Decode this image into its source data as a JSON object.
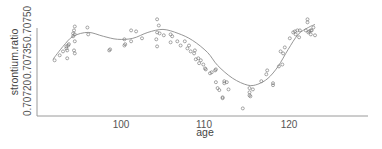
{
  "chart_data": {
    "type": "scatter",
    "title": "",
    "xlabel": "age",
    "ylabel": "strontium.ratio",
    "xlim": [
      91,
      130
    ],
    "ylim": [
      0.70716,
      0.70752
    ],
    "x_ticks": [
      100,
      110,
      120
    ],
    "x_tick_labels": [
      "100",
      "110",
      "120"
    ],
    "y_ticks": [
      0.7072,
      0.70735,
      0.7075
    ],
    "y_tick_labels": [
      "0.70720",
      "0.70735",
      "0.70750"
    ],
    "grid": false,
    "legend": null,
    "series": [
      {
        "name": "observations",
        "kind": "points",
        "marker": "open-circle",
        "x": [
          92.1,
          92.7,
          93.1,
          93.5,
          93.5,
          93.6,
          93.7,
          93.6,
          93.8,
          94.3,
          94.4,
          94.3,
          94.5,
          94.5,
          94.5,
          94.4,
          94.5,
          96.0,
          96.1,
          98.6,
          98.7,
          100.4,
          100.4,
          100.5,
          101.2,
          101.2,
          101.8,
          102.5,
          104.3,
          104.3,
          104.5,
          104.2,
          104.3,
          104.6,
          105.1,
          105.9,
          105.9,
          106.1,
          106.7,
          107.1,
          107.6,
          107.9,
          108.1,
          108.3,
          108.7,
          108.8,
          108.9,
          109.2,
          109.3,
          109.5,
          109.8,
          110.0,
          110.1,
          110.6,
          110.8,
          111.2,
          111.3,
          111.3,
          111.5,
          111.7,
          112.1,
          112.1,
          112.3,
          112.3,
          112.8,
          112.6,
          114.5,
          115.3,
          115.3,
          115.4,
          115.3,
          115.7,
          116.7,
          117.3,
          117.4,
          118.1,
          118.1,
          118.8,
          119.0,
          119.3,
          119.2,
          119.5,
          120.1,
          120.5,
          120.7,
          120.8,
          121.0,
          121.2,
          121.3,
          122.0,
          122.3,
          122.4,
          122.6,
          122.7,
          122.9,
          123.1,
          122.2,
          122.2,
          122.6
        ],
        "y": [
          0.707353,
          0.707373,
          0.707389,
          0.707401,
          0.707409,
          0.707393,
          0.707413,
          0.707361,
          0.707418,
          0.70745,
          0.707474,
          0.707462,
          0.70749,
          0.707458,
          0.70743,
          0.707393,
          0.707381,
          0.707486,
          0.707458,
          0.707393,
          0.707397,
          0.707438,
          0.707413,
          0.707418,
          0.707474,
          0.70743,
          0.70747,
          0.707442,
          0.707466,
          0.707519,
          0.707494,
          0.707438,
          0.707409,
          0.707462,
          0.707454,
          0.707458,
          0.707426,
          0.70745,
          0.70743,
          0.707413,
          0.70743,
          0.707401,
          0.707413,
          0.707389,
          0.707381,
          0.707393,
          0.707357,
          0.707361,
          0.707341,
          0.707353,
          0.707336,
          0.70732,
          0.707316,
          0.7073,
          0.707304,
          0.707312,
          0.707316,
          0.707264,
          0.70724,
          0.707232,
          0.707199,
          0.707203,
          0.707268,
          0.70726,
          0.707235,
          0.707264,
          0.707158,
          0.70724,
          0.707223,
          0.707207,
          0.707211,
          0.707235,
          0.707268,
          0.707296,
          0.707312,
          0.70726,
          0.707252,
          0.707328,
          0.707389,
          0.707381,
          0.707336,
          0.707405,
          0.707442,
          0.707466,
          0.70747,
          0.707458,
          0.707474,
          0.707446,
          0.707474,
          0.707474,
          0.707466,
          0.70747,
          0.707458,
          0.707474,
          0.707486,
          0.707454,
          0.707519,
          0.707507,
          0.707474
        ]
      },
      {
        "name": "smooth fit",
        "kind": "line",
        "x": [
          91.9,
          93.1,
          94.3,
          96.1,
          97.9,
          99.6,
          101.4,
          103.2,
          105.0,
          106.8,
          108.5,
          110.3,
          111.5,
          113.3,
          115.1,
          116.3,
          117.5,
          118.7,
          119.9,
          121.1,
          122.3,
          123.1
        ],
        "y": [
          0.707357,
          0.707409,
          0.70745,
          0.707466,
          0.70745,
          0.707438,
          0.707442,
          0.707466,
          0.707478,
          0.707462,
          0.707434,
          0.707385,
          0.707332,
          0.70728,
          0.707252,
          0.707256,
          0.70728,
          0.707328,
          0.707397,
          0.707458,
          0.707486,
          0.707498
        ]
      }
    ]
  },
  "axes": {
    "x_title": "age",
    "y_title": "strontium.ratio",
    "x_ticks": [
      {
        "label": "100",
        "px": 121
      },
      {
        "label": "110",
        "px": 204
      },
      {
        "label": "120",
        "px": 289
      }
    ],
    "y_ticks": [
      {
        "label": "0.70720",
        "py": 98
      },
      {
        "label": "0.70735",
        "py": 61
      },
      {
        "label": "0.70750",
        "py": 24
      }
    ]
  },
  "colors": {
    "points": "#6d6d6d",
    "trend": "#8a8a8a",
    "axis": "#9a9a9a",
    "text": "#555555"
  }
}
